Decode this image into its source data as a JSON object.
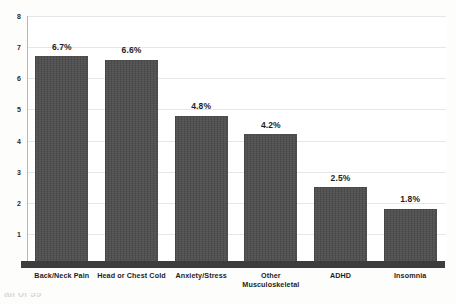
{
  "chart_data": {
    "type": "bar",
    "title": "",
    "subtitle": "",
    "xlabel": "",
    "ylabel": "",
    "categories": [
      "Back/Neck Pain",
      "Head or Chest Cold",
      "Anxiety/Stress",
      "Other Musculoskeletal",
      "ADHD",
      "Insomnia"
    ],
    "category_lines": [
      [
        "Back/Neck Pain"
      ],
      [
        "Head or Chest Cold"
      ],
      [
        "Anxiety/Stress"
      ],
      [
        "Other",
        "Musculoskeletal"
      ],
      [
        "ADHD"
      ],
      [
        "Insomnia"
      ]
    ],
    "values": [
      6.7,
      6.6,
      4.8,
      4.2,
      2.5,
      1.8
    ],
    "data_labels": [
      "6.7%",
      "6.6%",
      "4.8%",
      "4.2%",
      "2.5%",
      "1.8%"
    ],
    "ylim": [
      0,
      8
    ],
    "yticks": [
      8,
      7,
      6,
      5,
      4,
      3,
      2,
      1
    ],
    "ytick_labels": [
      "8",
      "7",
      "6",
      "5",
      "4",
      "3",
      "2",
      "1"
    ],
    "grid": true,
    "grid_axis": "y",
    "legend": false,
    "legend_position": "none",
    "bar_color": "#4c4c4c",
    "label_color": "#1e1e1e",
    "gridline_color": "#e6e6e2",
    "axis_color": "#b9b9b4",
    "baseline_color": "#3d3d3d",
    "background_color": "#fdfdfb"
  },
  "artifact": {
    "bottom_edge_text": "all of 55"
  }
}
